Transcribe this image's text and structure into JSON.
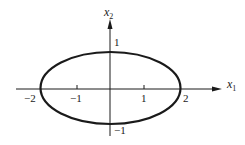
{
  "diagram": {
    "type": "ellipse-plot",
    "equation_hint": "x1^2/4 + x2^2 = 1",
    "axes": {
      "x_label": "x",
      "x_sub": "1",
      "y_label": "x",
      "y_sub": "2"
    },
    "ticks": {
      "x_neg2": "−2",
      "x_neg1": "−1",
      "x_pos1": "1",
      "x_pos2": "2",
      "y_pos1": "1",
      "y_neg1": "−1"
    },
    "colors": {
      "stroke": "#1a1a1a",
      "background": "#ffffff"
    }
  }
}
